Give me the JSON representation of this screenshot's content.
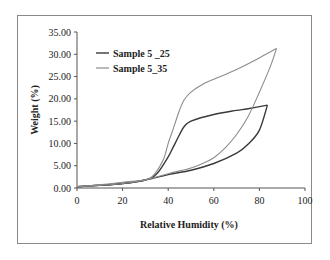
{
  "chart_data": {
    "type": "line",
    "title": "",
    "xlabel": "Relative Humidity (%)",
    "ylabel": "Weight (%)",
    "xlim": [
      0,
      100
    ],
    "ylim": [
      0,
      35
    ],
    "x_ticks": [
      "0",
      "20",
      "40",
      "60",
      "80",
      "100"
    ],
    "y_ticks": [
      "0.00",
      "5.00",
      "10.00",
      "15.00",
      "20.00",
      "25.00",
      "30.00",
      "35.00"
    ],
    "grid": false,
    "legend_position": "upper-left",
    "series": [
      {
        "name": "Sample 5 _25",
        "color": "#3a3a3a",
        "adsorption": {
          "x": [
            0,
            10,
            20,
            30,
            40,
            50,
            60,
            70,
            75,
            80,
            83.5
          ],
          "y": [
            0.3,
            0.6,
            1.0,
            1.8,
            3.0,
            4.0,
            5.5,
            7.8,
            9.8,
            13.0,
            18.6
          ]
        },
        "desorption": {
          "x": [
            83.5,
            75,
            70,
            60,
            50,
            47,
            45,
            42,
            40,
            35,
            30,
            20,
            10,
            0
          ],
          "y": [
            18.6,
            17.8,
            17.4,
            16.5,
            15.0,
            13.8,
            12.0,
            9.0,
            7.0,
            3.2,
            1.8,
            1.0,
            0.6,
            0.3
          ]
        }
      },
      {
        "name": "Sample 5_35",
        "color": "#8c8c8c",
        "adsorption": {
          "x": [
            0,
            10,
            20,
            30,
            40,
            50,
            55,
            60,
            65,
            70,
            75,
            80,
            85,
            87.5
          ],
          "y": [
            0.3,
            0.6,
            1.0,
            1.8,
            3.2,
            4.5,
            5.5,
            6.8,
            9.0,
            12.0,
            16.0,
            21.5,
            27.5,
            31.3
          ]
        },
        "desorption": {
          "x": [
            87.5,
            80,
            70,
            60,
            55,
            50,
            47,
            45,
            42,
            40,
            38,
            35,
            33,
            30,
            20,
            10,
            0
          ],
          "y": [
            31.3,
            29.2,
            26.6,
            24.4,
            23.2,
            21.5,
            19.8,
            17.5,
            13.0,
            10.0,
            6.5,
            3.8,
            2.6,
            1.8,
            1.3,
            0.7,
            0.3
          ]
        }
      }
    ]
  },
  "legend": {
    "items": [
      {
        "label": "Sample 5 _25",
        "color": "#3a3a3a"
      },
      {
        "label": "Sample 5_35",
        "color": "#8c8c8c"
      }
    ]
  },
  "axes": {
    "x_title": "Relative Humidity (%)",
    "y_title": "Weight (%)"
  }
}
